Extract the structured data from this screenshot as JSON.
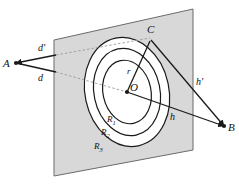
{
  "figure": {
    "type": "geometry-diagram",
    "background_color": "#ffffff",
    "plane_fill_color": "#d8d8d8",
    "plane_stroke_color": "#6b6b6b",
    "line_color": "#1a1a1a",
    "dashed_line_color": "#9a9a9a",
    "ellipse_stroke_color": "#1a1a1a",
    "ellipse_fill_color": "#ffffff"
  },
  "points": {
    "a": {
      "label": "A",
      "x": 14,
      "y": 63
    },
    "b": {
      "label": "B",
      "x": 226,
      "y": 127
    },
    "c": {
      "label": "C",
      "x": 150,
      "y": 38
    },
    "o": {
      "label": "O",
      "x": 127,
      "y": 92
    }
  },
  "segments": {
    "d_prime": {
      "label": "d'",
      "x": 44,
      "y": 48
    },
    "d": {
      "label": "d",
      "x": 41,
      "y": 78
    },
    "h_prime": {
      "label": "h'",
      "x": 199,
      "y": 82
    },
    "h": {
      "label": "h",
      "x": 172,
      "y": 117
    },
    "r": {
      "label": "r",
      "x": 129,
      "y": 71
    }
  },
  "regions": [
    {
      "label": "R",
      "subscript": "1",
      "x": 110,
      "y": 119
    },
    {
      "label": "R",
      "subscript": "2",
      "x": 104,
      "y": 132
    },
    {
      "label": "R",
      "subscript": "3",
      "x": 97,
      "y": 146
    }
  ],
  "plane": {
    "name": "projection-plane",
    "corners": [
      {
        "x": 54,
        "y": 40
      },
      {
        "x": 193,
        "y": 9
      },
      {
        "x": 193,
        "y": 150
      },
      {
        "x": 54,
        "y": 176
      }
    ]
  },
  "ellipses": [
    {
      "name": "ring-r1",
      "rx": 24,
      "ry": 32,
      "rotation": -12
    },
    {
      "name": "ring-r2",
      "rx": 33,
      "ry": 44,
      "rotation": -12
    },
    {
      "name": "ring-r3",
      "rx": 42,
      "ry": 55,
      "rotation": -12
    }
  ]
}
